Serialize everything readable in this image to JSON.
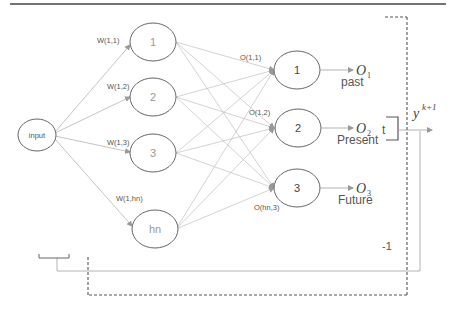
{
  "diagram": {
    "type": "neural-network-diagram",
    "input_node": {
      "label": "input"
    },
    "hidden_nodes": [
      {
        "label": "1",
        "weight_label": "W(1,1)"
      },
      {
        "label": "2",
        "weight_label": "W(1,2)"
      },
      {
        "label": "3",
        "weight_label": "W(1,3)"
      },
      {
        "label": "hn",
        "weight_label": "W(1,hn)"
      }
    ],
    "output_nodes": [
      {
        "label": "1",
        "weight_label": "O(1,1)",
        "output_symbol": "O",
        "output_subscript": "1",
        "caption": "past"
      },
      {
        "label": "2",
        "weight_label": "O(1,2)",
        "output_symbol": "O",
        "output_subscript": "2",
        "caption": "Present"
      },
      {
        "label": "3",
        "weight_label": "O(hn,3)",
        "output_symbol": "O",
        "output_subscript": "3",
        "caption": "Future"
      }
    ],
    "aggregate_fragment": "t",
    "final_output": {
      "symbol": "y",
      "superscript": "k+1"
    },
    "delay_label": "-1",
    "colors": {
      "edge": "#b0b0b0",
      "node_stroke": "#666666",
      "dashed": "#555555",
      "top_rule": "#444444"
    }
  }
}
